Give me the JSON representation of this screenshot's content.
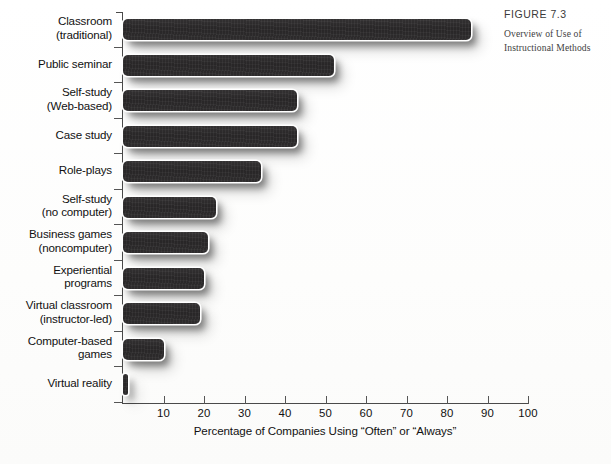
{
  "figure": {
    "number_label": "FIGURE 7.3",
    "caption_line1": "Overview of Use of",
    "caption_line2": "Instructional Methods"
  },
  "chart_data": {
    "type": "bar",
    "orientation": "horizontal",
    "title": "",
    "xlabel": "Percentage of Companies Using “Often” or “Always”",
    "ylabel": "",
    "xlim": [
      0,
      100
    ],
    "xticks": [
      10,
      20,
      30,
      40,
      50,
      60,
      70,
      80,
      90,
      100
    ],
    "grid": false,
    "legend": "none",
    "bar_color": "#2b2929",
    "categories": [
      "Classroom (traditional)",
      "Public seminar",
      "Self-study (Web-based)",
      "Case study",
      "Role-plays",
      "Self-study (no computer)",
      "Business games (noncomputer)",
      "Experiential programs",
      "Virtual classroom (instructor-led)",
      "Computer-based games",
      "Virtual reality"
    ],
    "values": [
      86,
      52,
      43,
      43,
      34,
      23,
      21,
      20,
      19,
      10,
      1
    ]
  },
  "rows": [
    {
      "label_line1": "Classroom",
      "label_line2": "(traditional)",
      "value": 86
    },
    {
      "label_line1": "Public seminar",
      "label_line2": "",
      "value": 52
    },
    {
      "label_line1": "Self-study",
      "label_line2": "(Web-based)",
      "value": 43
    },
    {
      "label_line1": "Case study",
      "label_line2": "",
      "value": 43
    },
    {
      "label_line1": "Role-plays",
      "label_line2": "",
      "value": 34
    },
    {
      "label_line1": "Self-study",
      "label_line2": "(no computer)",
      "value": 23
    },
    {
      "label_line1": "Business games",
      "label_line2": "(noncomputer)",
      "value": 21
    },
    {
      "label_line1": "Experiential",
      "label_line2": "programs",
      "value": 20
    },
    {
      "label_line1": "Virtual classroom",
      "label_line2": "(instructor-led)",
      "value": 19
    },
    {
      "label_line1": "Computer-based",
      "label_line2": "games",
      "value": 10
    },
    {
      "label_line1": "Virtual reality",
      "label_line2": "",
      "value": 1
    }
  ],
  "source_note": ""
}
